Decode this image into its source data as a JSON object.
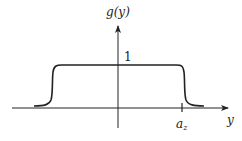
{
  "diagram": {
    "y_axis_label": "g(y)",
    "x_axis_label": "y",
    "level_label": "1",
    "tick_label_base": "a",
    "tick_label_sub": "z",
    "curve_description": "smooth flat-top function equal to 1 on plateau, decaying to 0 beyond ±a_z",
    "colors": {
      "stroke": "#222222",
      "background": "#ffffff"
    }
  }
}
